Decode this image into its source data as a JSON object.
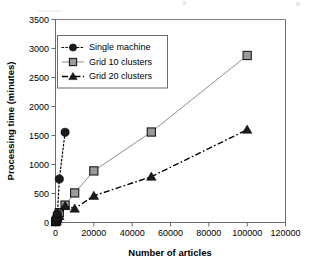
{
  "chart_data": {
    "type": "line",
    "title": "",
    "xlabel": "Number of articles",
    "ylabel": "Processing time (minutes)",
    "xlim": [
      0,
      120000
    ],
    "ylim": [
      0,
      3500
    ],
    "xticks": [
      0,
      20000,
      40000,
      60000,
      80000,
      100000,
      120000
    ],
    "yticks": [
      0,
      500,
      1000,
      1500,
      2000,
      2500,
      3000,
      3500
    ],
    "xtick_labels": [
      "0",
      "20000",
      "40000",
      "60000",
      "80000",
      "100000",
      "120000"
    ],
    "ytick_labels": [
      "0",
      "500",
      "1000",
      "1500",
      "2000",
      "2500",
      "3000",
      "3500"
    ],
    "grid": false,
    "legend_position": "upper-left-inside",
    "series": [
      {
        "name": "Single machine",
        "marker": "circle",
        "color": "#1a1a1a",
        "linestyle": "dotted",
        "x": [
          100,
          500,
          1000,
          2000,
          5000
        ],
        "y": [
          20,
          70,
          150,
          750,
          1555
        ]
      },
      {
        "name": "Grid 10 clusters",
        "marker": "square",
        "color": "#9a9a9a",
        "linestyle": "solid",
        "x": [
          100,
          500,
          1000,
          2000,
          5000,
          10000,
          20000,
          50000,
          100000
        ],
        "y": [
          15,
          40,
          95,
          170,
          300,
          510,
          890,
          1560,
          2880
        ]
      },
      {
        "name": "Grid 20 clusters",
        "marker": "triangle",
        "color": "#1a1a1a",
        "linestyle": "dashdot",
        "x": [
          100,
          500,
          1000,
          2000,
          5000,
          10000,
          20000,
          50000,
          100000
        ],
        "y": [
          10,
          25,
          55,
          110,
          285,
          240,
          460,
          790,
          1600
        ]
      }
    ]
  },
  "legend": {
    "items": [
      {
        "label": "Single machine"
      },
      {
        "label": "Grid 10 clusters"
      },
      {
        "label": "Grid 20 clusters"
      }
    ]
  }
}
